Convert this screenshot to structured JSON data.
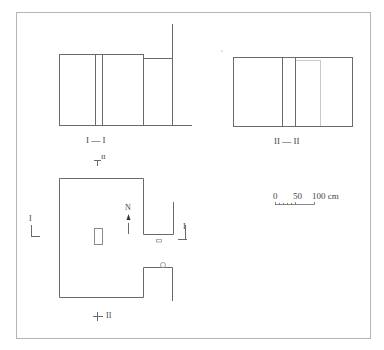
{
  "colors": {
    "frame": "#b5b5b5",
    "line": "#6a6a6a",
    "light_line": "#c8c8c8",
    "text": "#444444"
  },
  "section_1": {
    "title": "I — I",
    "section_marker": "II"
  },
  "section_2": {
    "title": "II — II"
  },
  "plan": {
    "north_label": "N",
    "marker_left": "I",
    "marker_right": "I",
    "marker_bottom": "II"
  },
  "scale_bar": {
    "tick_0": "0",
    "tick_50": "50",
    "tick_100": "100 cm"
  }
}
